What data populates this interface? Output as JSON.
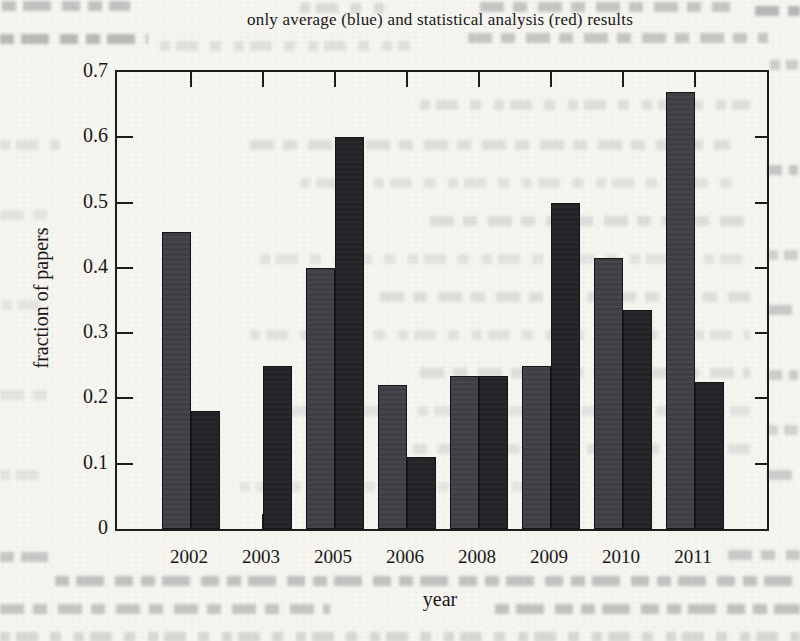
{
  "page": {
    "kind": "scanned book page with printed figure",
    "background_color": "#f5f4ef",
    "ink_color": "#1c1c1e"
  },
  "chart_data": {
    "type": "bar",
    "title": "only average (blue) and statistical analysis (red) results",
    "xlabel": "year",
    "ylabel": "fraction of papers",
    "ylim": [
      0,
      0.7
    ],
    "ytick_labels": [
      "0",
      "0.1",
      "0.2",
      "0.3",
      "0.4",
      "0.5",
      "0.6",
      "0.7"
    ],
    "categories": [
      "2002",
      "2003",
      "2005",
      "2006",
      "2008",
      "2009",
      "2010",
      "2011"
    ],
    "series": [
      {
        "name": "only average (blue)",
        "color": "#3e3e45",
        "values": [
          0.455,
          null,
          0.4,
          0.22,
          0.235,
          0.25,
          0.415,
          0.67
        ]
      },
      {
        "name": "statistical analysis (red)",
        "color": "#232327",
        "values": [
          0.18,
          0.25,
          0.6,
          0.11,
          0.235,
          0.5,
          0.335,
          0.225
        ]
      }
    ],
    "grid": false,
    "legend_position": "none (series colors named in title)"
  }
}
